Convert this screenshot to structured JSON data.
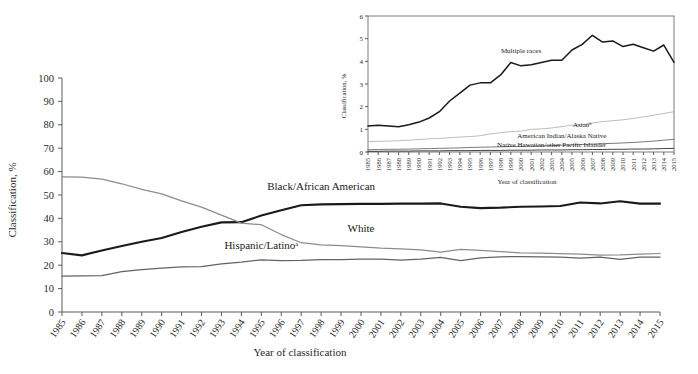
{
  "figure": {
    "title": "",
    "main_axis_title_x": "Year of classification",
    "main_axis_title_y": "Classification, %",
    "inset_axis_title_x": "Year of classification",
    "inset_axis_title_y": "Classification, %"
  },
  "colors": {
    "black_series": "#1a1a1a",
    "white_series": "#8c8c8c",
    "hispanic_series": "#636363",
    "multiple_races_series": "#1a1a1a",
    "asian_series": "#b4b4b4",
    "american_indian_series": "#6b6b6b",
    "native_hawaiian_series": "#2e2e2e",
    "axis": "#5a5a5a",
    "text": "#2a2a2a",
    "background": "#ffffff"
  },
  "chart_data": [
    {
      "id": "main-chart",
      "type": "line",
      "title": "",
      "xlabel": "Year of classification",
      "ylabel": "Classification, %",
      "grid": false,
      "legend_position": "inline-labels",
      "xlim": [
        1985,
        2015
      ],
      "ylim": [
        0,
        100
      ],
      "yticks": [
        0,
        10,
        20,
        30,
        40,
        50,
        60,
        70,
        80,
        90,
        100
      ],
      "categories": [
        1985,
        1986,
        1987,
        1988,
        1989,
        1990,
        1991,
        1992,
        1993,
        1994,
        1995,
        1996,
        1997,
        1998,
        1999,
        2000,
        2001,
        2002,
        2003,
        2004,
        2005,
        2006,
        2007,
        2008,
        2009,
        2010,
        2011,
        2012,
        2013,
        2014,
        2015
      ],
      "series": [
        {
          "name": "Black/African American",
          "color": "#1a1a1a",
          "values": [
            25.2,
            24.2,
            26.3,
            28.2,
            30.0,
            31.6,
            34.2,
            36.4,
            38.3,
            38.4,
            41.2,
            43.5,
            45.6,
            46.0,
            46.1,
            46.2,
            46.2,
            46.3,
            46.3,
            46.4,
            45.0,
            44.4,
            44.6,
            45.0,
            45.1,
            45.3,
            46.8,
            46.4,
            47.3,
            46.3,
            46.3
          ]
        },
        {
          "name": "White",
          "color": "#8c8c8c",
          "values": [
            57.7,
            57.6,
            56.8,
            54.8,
            52.4,
            50.5,
            47.5,
            44.8,
            41.4,
            38.0,
            37.3,
            33.1,
            29.6,
            28.7,
            28.4,
            27.8,
            27.3,
            27.0,
            26.5,
            25.6,
            26.8,
            26.3,
            25.8,
            25.3,
            25.2,
            24.9,
            24.7,
            24.3,
            24.4,
            24.7,
            25.0
          ]
        },
        {
          "name": "Hispanic/Latinoᵃ",
          "color": "#636363",
          "values": [
            15.3,
            15.4,
            15.5,
            17.3,
            18.1,
            18.7,
            19.3,
            19.4,
            20.6,
            21.3,
            22.3,
            22.0,
            22.1,
            22.4,
            22.4,
            22.6,
            22.6,
            22.2,
            22.6,
            23.3,
            22.0,
            23.1,
            23.6,
            23.7,
            23.6,
            23.5,
            23.0,
            23.4,
            22.5,
            23.5,
            23.4
          ]
        }
      ],
      "series_labels": [
        {
          "text": "Black/African American",
          "anchor_year": 1998,
          "anchor_value": 52
        },
        {
          "text": "White",
          "anchor_year": 2000,
          "anchor_value": 34
        },
        {
          "text": "Hispanic/Latinoᵃ",
          "anchor_year": 1995,
          "anchor_value": 27
        }
      ]
    },
    {
      "id": "inset-chart",
      "type": "line",
      "title": "",
      "xlabel": "Year of classification",
      "ylabel": "Classification, %",
      "grid": false,
      "legend_position": "inline-labels",
      "xlim": [
        1985,
        2015
      ],
      "ylim": [
        0,
        6
      ],
      "yticks": [
        0,
        1,
        2,
        3,
        4,
        5,
        6
      ],
      "categories": [
        1985,
        1986,
        1987,
        1988,
        1989,
        1990,
        1991,
        1992,
        1993,
        1994,
        1995,
        1996,
        1997,
        1998,
        1999,
        2000,
        2001,
        2002,
        2003,
        2004,
        2005,
        2006,
        2007,
        2008,
        2009,
        2010,
        2011,
        2012,
        2013,
        2014,
        2015
      ],
      "series": [
        {
          "name": "Multiple races",
          "color": "#1a1a1a",
          "values": [
            1.15,
            1.18,
            1.15,
            1.11,
            1.2,
            1.32,
            1.5,
            1.78,
            2.25,
            2.6,
            2.95,
            3.05,
            3.05,
            3.4,
            3.95,
            3.8,
            3.85,
            3.95,
            4.05,
            4.05,
            4.5,
            4.75,
            5.15,
            4.85,
            4.9,
            4.65,
            4.75,
            4.6,
            4.45,
            4.72,
            3.95
          ]
        },
        {
          "name": "Asianᵇ",
          "color": "#b4b4b4",
          "values": [
            0.46,
            0.47,
            0.48,
            0.5,
            0.52,
            0.55,
            0.58,
            0.6,
            0.63,
            0.66,
            0.68,
            0.72,
            0.8,
            0.85,
            0.9,
            0.92,
            1.0,
            1.02,
            1.06,
            1.12,
            1.18,
            1.2,
            1.28,
            1.34,
            1.38,
            1.42,
            1.48,
            1.55,
            1.62,
            1.7,
            1.78
          ]
        },
        {
          "name": "American Indian/Alaska Native",
          "color": "#6b6b6b",
          "values": [
            0.1,
            0.11,
            0.12,
            0.12,
            0.13,
            0.14,
            0.15,
            0.16,
            0.17,
            0.18,
            0.2,
            0.21,
            0.22,
            0.23,
            0.24,
            0.25,
            0.26,
            0.27,
            0.28,
            0.3,
            0.31,
            0.33,
            0.35,
            0.37,
            0.38,
            0.4,
            0.42,
            0.45,
            0.48,
            0.52,
            0.56
          ]
        },
        {
          "name": "Native Hawaiian/other Pacific Islander",
          "color": "#2e2e2e",
          "values": [
            0.03,
            0.03,
            0.04,
            0.04,
            0.04,
            0.05,
            0.05,
            0.05,
            0.06,
            0.06,
            0.06,
            0.07,
            0.07,
            0.07,
            0.08,
            0.08,
            0.08,
            0.09,
            0.09,
            0.09,
            0.1,
            0.1,
            0.11,
            0.11,
            0.12,
            0.12,
            0.13,
            0.13,
            0.14,
            0.15,
            0.16
          ]
        }
      ],
      "series_labels": [
        {
          "text": "Multiple races",
          "anchor_year": 2000,
          "anchor_value": 4.35
        },
        {
          "text": "Asianᵇ",
          "anchor_year": 2006,
          "anchor_value": 1.12
        },
        {
          "text": "American Indian/Alaska Native",
          "anchor_year": 2004,
          "anchor_value": 0.62
        },
        {
          "text": "Native Hawaiian/other Pacific Islander",
          "anchor_year": 2003,
          "anchor_value": 0.2
        }
      ]
    }
  ]
}
